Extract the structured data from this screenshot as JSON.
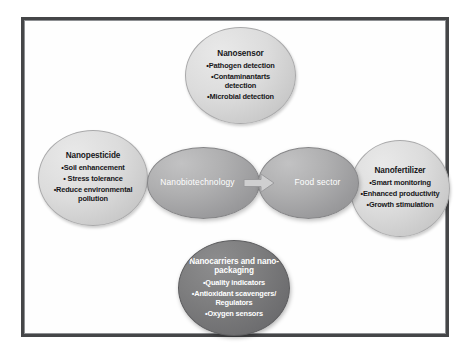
{
  "figure": {
    "frame_color": "#454648",
    "background": "#ffffff",
    "core": {
      "left_label": "Nanobiotechnology",
      "right_label": "Food sector",
      "arrow": "right-arrow-icon"
    },
    "nodes": [
      {
        "id": "nanosensor",
        "title": "Nanosensor",
        "style": "light",
        "items": [
          "•Pathogen detection",
          "•Contaminantarts\ndetection",
          "•Microbial detection"
        ]
      },
      {
        "id": "nanopesticide",
        "title": "Nanopesticide",
        "style": "light",
        "items": [
          "•Soil enhancement",
          "• Stress tolerance",
          "•Reduce environmental\npollution"
        ]
      },
      {
        "id": "nanofertilizer",
        "title": "Nanofertilizer",
        "style": "light",
        "items": [
          "•Smart  monitoring",
          "•Enhanced productivity",
          "•Growth stimulation"
        ]
      },
      {
        "id": "nanocarriers",
        "title": "Nanocarriers and nano-\npackaging",
        "style": "dark",
        "items": [
          "•Quality indicators",
          "•Antioxidant scavengers/\nRegulators",
          "•Oxygen sensors"
        ]
      }
    ]
  }
}
